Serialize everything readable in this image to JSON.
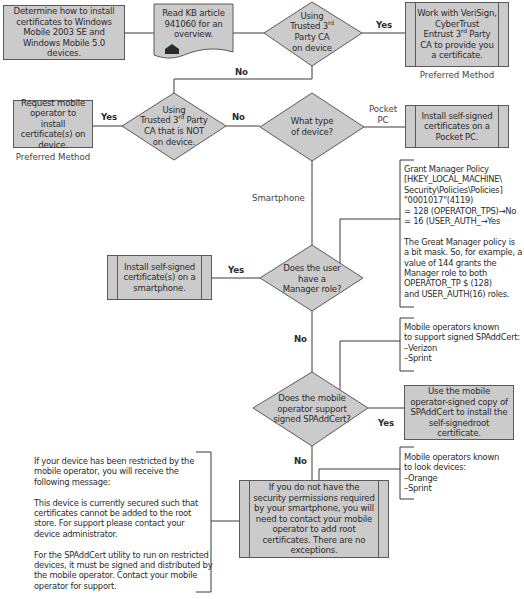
{
  "diagram": {
    "colors": {
      "shape_fill": "#cbcbcb",
      "shape_stroke": "#5a5a5a",
      "connector": "#3a3a3a",
      "text": "#2b2b2b"
    },
    "nodes": {
      "start": {
        "type": "process",
        "text": "Determine how to install certificates to Windows Mobile 2003 SE and Windows Mobile 5.0 devices."
      },
      "kb_article": {
        "type": "document",
        "text": "Read KB article 941060 for an overview.",
        "icon": "house-icon"
      },
      "decision_trusted_ca": {
        "type": "decision",
        "line1": "Using",
        "line2_pre": "Trusted 3",
        "line2_sup": "rd",
        "line3": "Party CA",
        "line4": "on device"
      },
      "work_with_ca": {
        "type": "predefined-process",
        "line1": "Work with VeriSign,",
        "line2": "CyberTrust",
        "line3_pre": "Entrust 3",
        "line3_sup": "rd",
        "line3_post": " Party",
        "line4": "CA to provide you",
        "line5": "a certificate.",
        "caption": "Preferred Method"
      },
      "decision_not_on_device": {
        "type": "decision",
        "line1": "Using",
        "line2_pre": "Trusted 3",
        "line2_sup": "rd",
        "line2_post": " Party",
        "line3": "CA that is NOT",
        "line4": "on device."
      },
      "request_operator": {
        "type": "process",
        "text": "Request mobile operator to install certificate(s) on device.",
        "caption": "Preferred Method"
      },
      "decision_device_type": {
        "type": "decision",
        "text": "What type of device?"
      },
      "install_pocket_pc": {
        "type": "predefined-process",
        "text": "Install self-signed certificates on a Pocket PC."
      },
      "decision_manager_role": {
        "type": "decision",
        "text": "Does the user have a Manager role?"
      },
      "install_smartphone": {
        "type": "predefined-process",
        "text": "Install self-signed certificate(s) on a smartphone."
      },
      "decision_spaddcert": {
        "type": "decision",
        "text": "Does the mobile operator support signed SPAddCert?"
      },
      "use_spaddcert": {
        "type": "process",
        "text": "Use the mobile operator-signed copy of SPAddCert to install the self-signedroot certificate."
      },
      "contact_operator": {
        "type": "predefined-process",
        "text": "If you do not have the security permissions required by your smartphone, you will need to contact your mobile operator to add root certificates. There are no exceptions."
      }
    },
    "edge_labels": {
      "trusted_ca_yes": "Yes",
      "trusted_ca_no": "No",
      "not_on_device_yes": "Yes",
      "not_on_device_no": "No",
      "device_pocket_pc": "Pocket\nPC",
      "device_smartphone": "Smartphone",
      "manager_yes": "Yes",
      "manager_no": "No",
      "spaddcert_yes": "Yes",
      "spaddcert_no": "No"
    },
    "annotations": {
      "grant_manager_policy": "Grant Manager Policy\n[HKEY_LOCAL_MACHINE\\\nSecurity\\Policies\\Policies]\n  \"0001017\"(4119)\n= 128 (OPERATOR_TPS)→No\n= 16 (USER_AUTH_→Yes\n\nThe Great Manager policy is\na bit mask. So, for example, a\nvalue of 144 grants the\nManager role to both\nOPERATOR_TP $ (128)\nand USER_AUTH(16) roles.",
      "operators_support_spaddcert": "Mobile operators known\nto support signed SPAddCert:\n–Verizon\n–Sprint",
      "operators_lock_devices": "Mobile operators known\nto look devices:\n–Orange\n–Sprint",
      "restricted_device_message": "If your device has been restricted by the\nmobile operator, you will receive the\nfollowing message:\n\nThis device is currently secured such that\ncertificates cannot be added to the root\nstore. For support please contact your\ndevice administrator.\n\nFor the SPAddCert utility to run on restricted\ndevices, it must be signed and distributed by\nthe mobile operator. Contact your mobile\noperator for support."
    }
  }
}
